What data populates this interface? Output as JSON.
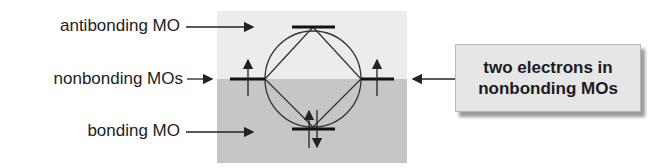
{
  "labels": {
    "antibonding": "antibonding MO",
    "nonbonding": "nonbonding MOs",
    "bonding": "bonding MO"
  },
  "callout": {
    "line1": "two electrons in",
    "line2": "nonbonding MOs"
  },
  "colors": {
    "upper_region": "#ececec",
    "lower_region": "#c6c6c6",
    "line": "#222222",
    "callout_bg": "#e6e6e6"
  },
  "orbitals": {
    "antibonding": {
      "electrons": 0
    },
    "nonbonding_left": {
      "electrons": 1,
      "spin": "up"
    },
    "nonbonding_right": {
      "electrons": 1,
      "spin": "up"
    },
    "bonding": {
      "electrons": 2,
      "spin": "up-down"
    }
  }
}
